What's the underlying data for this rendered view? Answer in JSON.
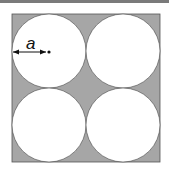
{
  "diagram": {
    "label": "a",
    "label_meaning": "radius of circle",
    "colors": {
      "shaded": "#a6a6a6",
      "circle_fill": "#ffffff",
      "stroke": "#333333",
      "top_strip": "#7a7a7a"
    },
    "square": {
      "x": 12,
      "y": 14,
      "size": 148
    },
    "circles": [
      {
        "cx": 49,
        "cy": 51,
        "r": 37
      },
      {
        "cx": 123,
        "cy": 51,
        "r": 37
      },
      {
        "cx": 49,
        "cy": 125,
        "r": 37
      },
      {
        "cx": 123,
        "cy": 125,
        "r": 37
      }
    ]
  }
}
